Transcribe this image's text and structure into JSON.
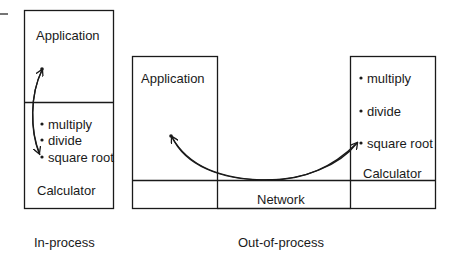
{
  "diagram": {
    "in_process": {
      "caption": "In-process",
      "application_label": "Application",
      "calculator_label": "Calculator",
      "methods": [
        "multiply",
        "divide",
        "square root"
      ]
    },
    "out_of_process": {
      "caption": "Out-of-process",
      "application_label": "Application",
      "network_label": "Network",
      "calculator_label": "Calculator",
      "methods": [
        "multiply",
        "divide",
        "square root"
      ]
    },
    "colors": {
      "stroke": "#1a1a1a",
      "background": "#ffffff"
    }
  }
}
